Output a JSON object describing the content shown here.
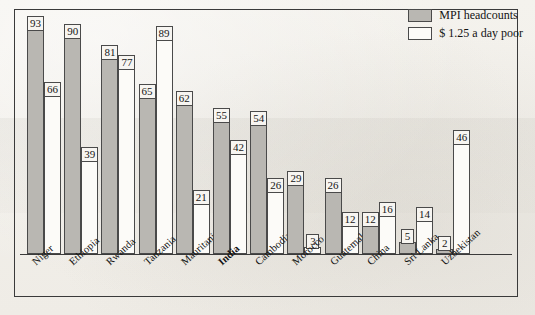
{
  "chart_data": {
    "type": "bar",
    "title": "",
    "xlabel": "",
    "ylabel": "",
    "ylim": [
      0,
      100
    ],
    "grid": false,
    "legend_position": "top-right",
    "categories": [
      "Niger",
      "Ethiopia",
      "Rwanda",
      "Tanzania",
      "Mauritania",
      "India",
      "Cambodia",
      "Morocco",
      "Guatemala",
      "China",
      "Sri Lanka",
      "Uzbekistan"
    ],
    "highlighted_category": "India",
    "series": [
      {
        "name": "MPI headcounts",
        "color": "#b9b7b2",
        "values": [
          93,
          90,
          81,
          65,
          62,
          55,
          54,
          29,
          26,
          12,
          5,
          2
        ]
      },
      {
        "name": "$ 1.25 a day poor",
        "color": "#fcfbf8",
        "values": [
          66,
          39,
          77,
          89,
          21,
          42,
          26,
          3,
          12,
          16,
          14,
          46
        ]
      }
    ]
  },
  "legend": {
    "items": [
      {
        "label": "MPI headcounts",
        "swatch": "gray"
      },
      {
        "label": "$ 1.25 a day poor",
        "swatch": "white"
      }
    ]
  }
}
